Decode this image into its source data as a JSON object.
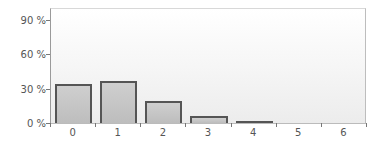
{
  "chart_data": {
    "type": "bar",
    "title": "",
    "xlabel": "",
    "ylabel": "",
    "categories": [
      "0",
      "1",
      "2",
      "3",
      "4",
      "5",
      "6"
    ],
    "values": [
      34,
      37,
      19,
      6,
      1.5,
      0,
      0
    ],
    "value_unit": "%",
    "ylim": [
      0,
      100
    ],
    "yticks": [
      0,
      30,
      60,
      90
    ],
    "ytick_labels": [
      "0 %",
      "30 %",
      "60 %",
      "90 %"
    ],
    "grid": false,
    "legend": null,
    "colors": {
      "bar_fill": "#c6c6c6",
      "bar_border": "#555555"
    }
  }
}
